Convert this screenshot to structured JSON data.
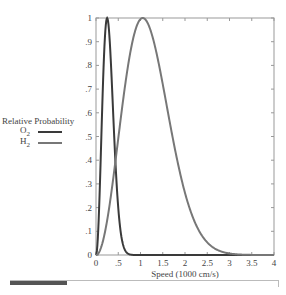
{
  "chart_data": {
    "type": "line",
    "title": "",
    "xlabel": "Speed (1000 cm/s)",
    "ylabel": "Relative Probability",
    "xlim": [
      0,
      4
    ],
    "ylim": [
      0,
      1
    ],
    "xticks": [
      "0",
      ".5",
      "1",
      "1.5",
      "2",
      "2.5",
      "3",
      "3.5",
      "4"
    ],
    "yticks": [
      "0",
      ".1",
      ".2",
      ".3",
      ".4",
      ".5",
      ".6",
      ".7",
      ".8",
      ".9",
      "1"
    ],
    "grid": false,
    "legend_position": "left",
    "series": [
      {
        "name": "O2",
        "color": "#3a3a3a",
        "peak_x": 0.25,
        "x": [
          0,
          0.05,
          0.1,
          0.15,
          0.2,
          0.25,
          0.3,
          0.35,
          0.4,
          0.45,
          0.5,
          0.6,
          0.7,
          0.8,
          0.9,
          1.0
        ],
        "values": [
          0,
          0.1,
          0.37,
          0.69,
          0.93,
          1.0,
          0.93,
          0.77,
          0.59,
          0.42,
          0.27,
          0.09,
          0.02,
          0.004,
          0.001,
          0
        ]
      },
      {
        "name": "H2",
        "color": "#777777",
        "peak_x": 1.05,
        "x": [
          0,
          0.25,
          0.5,
          0.75,
          1.0,
          1.05,
          1.25,
          1.5,
          1.75,
          2.0,
          2.25,
          2.5,
          2.75,
          3.0,
          3.25,
          3.5,
          4.0
        ],
        "values": [
          0,
          0.15,
          0.5,
          0.83,
          0.99,
          1.0,
          0.95,
          0.8,
          0.59,
          0.4,
          0.24,
          0.13,
          0.06,
          0.025,
          0.01,
          0.003,
          0
        ]
      }
    ]
  },
  "legend": {
    "title": "Relative Probability",
    "items": [
      {
        "label": "O",
        "sub": "2",
        "color": "#3a3a3a"
      },
      {
        "label": "H",
        "sub": "2",
        "color": "#777777"
      }
    ]
  }
}
